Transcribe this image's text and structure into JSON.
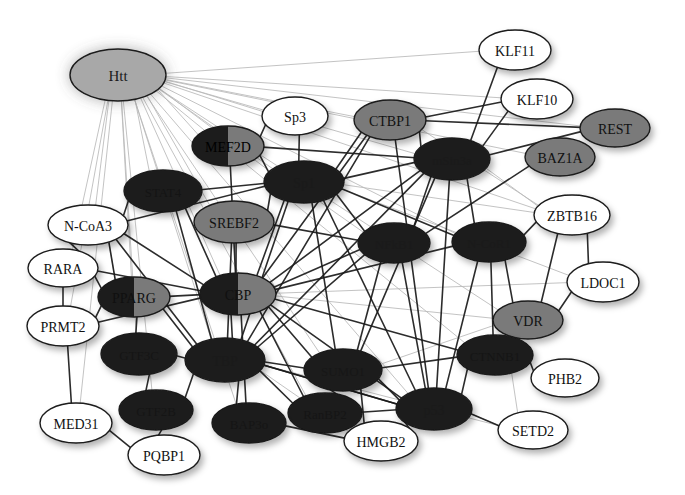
{
  "diagram": {
    "type": "protein-interaction-network",
    "background": "#ffffff",
    "palette": {
      "white_fill": "#ffffff",
      "light_gray_fill": "#a8a8a8",
      "mid_gray_fill": "#7a7a7a",
      "dark_fill": "#1d1d1d",
      "node_stroke": "#1a1a1a",
      "white_label": "#111111",
      "dark_label": "#000000",
      "edge_dark": "#1a1a1a",
      "edge_light": "#b9b9b9"
    },
    "nodes": [
      {
        "id": "Htt",
        "label": "Htt",
        "x": 118,
        "y": 75,
        "rx": 48,
        "ry": 26,
        "fill": "light_gray_fill",
        "labelColor": "#1a1a1a",
        "fontSize": 15,
        "twoTone": false
      },
      {
        "id": "KLF11",
        "label": "KLF11",
        "x": 515,
        "y": 50,
        "rx": 36,
        "ry": 20,
        "fill": "white_fill",
        "labelColor": "#111111",
        "fontSize": 14,
        "twoTone": false
      },
      {
        "id": "KLF10",
        "label": "KLF10",
        "x": 537,
        "y": 99,
        "rx": 36,
        "ry": 20,
        "fill": "white_fill",
        "labelColor": "#111111",
        "fontSize": 14,
        "twoTone": false
      },
      {
        "id": "Sp3",
        "label": "Sp3",
        "x": 295,
        "y": 116,
        "rx": 33,
        "ry": 19,
        "fill": "white_fill",
        "labelColor": "#111111",
        "fontSize": 14,
        "twoTone": false
      },
      {
        "id": "CTBP1",
        "label": "CTBP1",
        "x": 390,
        "y": 120,
        "rx": 36,
        "ry": 20,
        "fill": "mid_gray_fill",
        "labelColor": "#111111",
        "fontSize": 14,
        "twoTone": false
      },
      {
        "id": "REST",
        "label": "REST",
        "x": 615,
        "y": 128,
        "rx": 35,
        "ry": 19,
        "fill": "mid_gray_fill",
        "labelColor": "#111111",
        "fontSize": 14,
        "twoTone": false
      },
      {
        "id": "MEF2D",
        "label": "MEF2D",
        "x": 228,
        "y": 146,
        "rx": 36,
        "ry": 20,
        "fill": "dark_fill",
        "labelColor": "#000000",
        "fontSize": 14,
        "twoTone": true
      },
      {
        "id": "mSin3a",
        "label": "mSin3a",
        "x": 452,
        "y": 159,
        "rx": 38,
        "ry": 21,
        "fill": "dark_fill",
        "labelColor": "#1a1a1a",
        "fontSize": 13,
        "twoTone": false
      },
      {
        "id": "BAZ1A",
        "label": "BAZ1A",
        "x": 560,
        "y": 157,
        "rx": 35,
        "ry": 19,
        "fill": "mid_gray_fill",
        "labelColor": "#111111",
        "fontSize": 14,
        "twoTone": false
      },
      {
        "id": "STAT4",
        "label": "STAT4",
        "x": 163,
        "y": 191,
        "rx": 39,
        "ry": 21,
        "fill": "dark_fill",
        "labelColor": "#141414",
        "fontSize": 13,
        "twoTone": false
      },
      {
        "id": "Sp1",
        "label": "Sp1",
        "x": 304,
        "y": 182,
        "rx": 40,
        "ry": 21,
        "fill": "dark_fill",
        "labelColor": "#1a1a1a",
        "fontSize": 14,
        "twoTone": false
      },
      {
        "id": "SREBF2",
        "label": "SREBF2",
        "x": 234,
        "y": 222,
        "rx": 40,
        "ry": 21,
        "fill": "mid_gray_fill",
        "labelColor": "#111111",
        "fontSize": 14,
        "twoTone": false
      },
      {
        "id": "ZBTB16",
        "label": "ZBTB16",
        "x": 572,
        "y": 215,
        "rx": 38,
        "ry": 20,
        "fill": "white_fill",
        "labelColor": "#111111",
        "fontSize": 14,
        "twoTone": false
      },
      {
        "id": "N-CoA3",
        "label": "N-CoA3",
        "x": 88,
        "y": 225,
        "rx": 40,
        "ry": 20,
        "fill": "white_fill",
        "labelColor": "#111111",
        "fontSize": 14,
        "twoTone": false
      },
      {
        "id": "NFkB1",
        "label": "NFkB1",
        "x": 394,
        "y": 243,
        "rx": 36,
        "ry": 20,
        "fill": "dark_fill",
        "labelColor": "#1a1a1a",
        "fontSize": 13,
        "twoTone": false
      },
      {
        "id": "N-CoR1",
        "label": "N-CoR1",
        "x": 489,
        "y": 242,
        "rx": 37,
        "ry": 20,
        "fill": "dark_fill",
        "labelColor": "#1a1a1a",
        "fontSize": 13,
        "twoTone": false
      },
      {
        "id": "RARA",
        "label": "RARA",
        "x": 63,
        "y": 268,
        "rx": 35,
        "ry": 19,
        "fill": "white_fill",
        "labelColor": "#111111",
        "fontSize": 14,
        "twoTone": false
      },
      {
        "id": "LDOC1",
        "label": "LDOC1",
        "x": 603,
        "y": 282,
        "rx": 36,
        "ry": 20,
        "fill": "white_fill",
        "labelColor": "#111111",
        "fontSize": 14,
        "twoTone": false
      },
      {
        "id": "PPARG",
        "label": "PPARG",
        "x": 134,
        "y": 297,
        "rx": 36,
        "ry": 20,
        "fill": "dark_fill",
        "labelColor": "#101010",
        "fontSize": 14,
        "twoTone": true
      },
      {
        "id": "CBP",
        "label": "CBP",
        "x": 238,
        "y": 294,
        "rx": 38,
        "ry": 21,
        "fill": "dark_fill",
        "labelColor": "#101010",
        "fontSize": 14,
        "twoTone": true
      },
      {
        "id": "PRMT2",
        "label": "PRMT2",
        "x": 63,
        "y": 326,
        "rx": 36,
        "ry": 20,
        "fill": "white_fill",
        "labelColor": "#111111",
        "fontSize": 14,
        "twoTone": false
      },
      {
        "id": "VDR",
        "label": "VDR",
        "x": 528,
        "y": 320,
        "rx": 35,
        "ry": 19,
        "fill": "mid_gray_fill",
        "labelColor": "#111111",
        "fontSize": 14,
        "twoTone": false
      },
      {
        "id": "GTF3C",
        "label": "GTF3C",
        "x": 139,
        "y": 354,
        "rx": 38,
        "ry": 21,
        "fill": "dark_fill",
        "labelColor": "#151515",
        "fontSize": 13,
        "twoTone": false
      },
      {
        "id": "TBP",
        "label": "TBP",
        "x": 225,
        "y": 360,
        "rx": 40,
        "ry": 22,
        "fill": "dark_fill",
        "labelColor": "#1a1a1a",
        "fontSize": 14,
        "twoTone": false
      },
      {
        "id": "SUMO1",
        "label": "SUMO1",
        "x": 343,
        "y": 370,
        "rx": 39,
        "ry": 21,
        "fill": "dark_fill",
        "labelColor": "#171717",
        "fontSize": 13,
        "twoTone": false
      },
      {
        "id": "CTNNB1",
        "label": "CTNNB1",
        "x": 495,
        "y": 355,
        "rx": 38,
        "ry": 20,
        "fill": "dark_fill",
        "labelColor": "#151515",
        "fontSize": 13,
        "twoTone": false
      },
      {
        "id": "PHB2",
        "label": "PHB2",
        "x": 565,
        "y": 378,
        "rx": 34,
        "ry": 19,
        "fill": "white_fill",
        "labelColor": "#111111",
        "fontSize": 14,
        "twoTone": false
      },
      {
        "id": "GTF2B",
        "label": "GTF2B",
        "x": 156,
        "y": 410,
        "rx": 37,
        "ry": 20,
        "fill": "dark_fill",
        "labelColor": "#151515",
        "fontSize": 13,
        "twoTone": false
      },
      {
        "id": "RanBP2",
        "label": "RanBP2",
        "x": 325,
        "y": 413,
        "rx": 37,
        "ry": 20,
        "fill": "dark_fill",
        "labelColor": "#151515",
        "fontSize": 13,
        "twoTone": false
      },
      {
        "id": "BAP3o",
        "label": "BAP3o",
        "x": 249,
        "y": 423,
        "rx": 37,
        "ry": 20,
        "fill": "dark_fill",
        "labelColor": "#151515",
        "fontSize": 13,
        "twoTone": false
      },
      {
        "id": "p53",
        "label": "p53",
        "x": 434,
        "y": 409,
        "rx": 38,
        "ry": 21,
        "fill": "dark_fill",
        "labelColor": "#1a1a1a",
        "fontSize": 14,
        "twoTone": false
      },
      {
        "id": "SETD2",
        "label": "SETD2",
        "x": 533,
        "y": 430,
        "rx": 35,
        "ry": 19,
        "fill": "white_fill",
        "labelColor": "#111111",
        "fontSize": 14,
        "twoTone": false
      },
      {
        "id": "MED31",
        "label": "MED31",
        "x": 76,
        "y": 423,
        "rx": 36,
        "ry": 20,
        "fill": "white_fill",
        "labelColor": "#111111",
        "fontSize": 14,
        "twoTone": false
      },
      {
        "id": "PQBP1",
        "label": "PQBP1",
        "x": 164,
        "y": 455,
        "rx": 36,
        "ry": 20,
        "fill": "white_fill",
        "labelColor": "#111111",
        "fontSize": 14,
        "twoTone": false
      },
      {
        "id": "HMGB2",
        "label": "HMGB2",
        "x": 381,
        "y": 441,
        "rx": 37,
        "ry": 20,
        "fill": "white_fill",
        "labelColor": "#111111",
        "fontSize": 14,
        "twoTone": false
      }
    ],
    "edges_light": [
      {
        "from": "Htt",
        "to": "KLF11"
      },
      {
        "from": "Htt",
        "to": "KLF10"
      },
      {
        "from": "Htt",
        "to": "REST"
      },
      {
        "from": "Htt",
        "to": "BAZ1A"
      },
      {
        "from": "Htt",
        "to": "CTBP1"
      },
      {
        "from": "Htt",
        "to": "Sp3"
      },
      {
        "from": "Htt",
        "to": "MEF2D"
      },
      {
        "from": "Htt",
        "to": "mSin3a"
      },
      {
        "from": "Htt",
        "to": "Sp1"
      },
      {
        "from": "Htt",
        "to": "SREBF2"
      },
      {
        "from": "Htt",
        "to": "STAT4"
      },
      {
        "from": "Htt",
        "to": "N-CoA3"
      },
      {
        "from": "Htt",
        "to": "RARA"
      },
      {
        "from": "Htt",
        "to": "NFkB1"
      },
      {
        "from": "Htt",
        "to": "N-CoR1"
      },
      {
        "from": "Htt",
        "to": "ZBTB16"
      },
      {
        "from": "Htt",
        "to": "CBP"
      },
      {
        "from": "Htt",
        "to": "PPARG"
      },
      {
        "from": "Htt",
        "to": "TBP"
      },
      {
        "from": "Htt",
        "to": "GTF3C"
      },
      {
        "from": "Htt",
        "to": "GTF2B"
      },
      {
        "from": "Htt",
        "to": "SUMO1"
      },
      {
        "from": "Htt",
        "to": "p53"
      },
      {
        "from": "Htt",
        "to": "VDR"
      },
      {
        "from": "Htt",
        "to": "PRMT2"
      },
      {
        "from": "Htt",
        "to": "MED31"
      },
      {
        "from": "Htt",
        "to": "CTNNB1"
      },
      {
        "from": "Htt",
        "to": "BAP3o"
      },
      {
        "from": "Htt",
        "to": "RanBP2"
      },
      {
        "from": "Sp1",
        "to": "ZBTB16"
      },
      {
        "from": "Sp1",
        "to": "LDOC1"
      },
      {
        "from": "mSin3a",
        "to": "ZBTB16"
      },
      {
        "from": "CTBP1",
        "to": "ZBTB16"
      },
      {
        "from": "CBP",
        "to": "LDOC1"
      },
      {
        "from": "p53",
        "to": "SETD2"
      },
      {
        "from": "CTNNB1",
        "to": "SETD2"
      },
      {
        "from": "TBP",
        "to": "SETD2"
      },
      {
        "from": "SUMO1",
        "to": "VDR"
      },
      {
        "from": "N-CoA3",
        "to": "PPARG"
      },
      {
        "from": "CBP",
        "to": "VDR"
      },
      {
        "from": "TBP",
        "to": "HMGB2"
      }
    ],
    "edges_dark": [
      {
        "from": "KLF11",
        "to": "mSin3a"
      },
      {
        "from": "KLF10",
        "to": "mSin3a"
      },
      {
        "from": "KLF10",
        "to": "CTBP1"
      },
      {
        "from": "REST",
        "to": "mSin3a"
      },
      {
        "from": "REST",
        "to": "CTBP1"
      },
      {
        "from": "BAZ1A",
        "to": "NFkB1"
      },
      {
        "from": "CTBP1",
        "to": "mSin3a"
      },
      {
        "from": "CTBP1",
        "to": "Sp1"
      },
      {
        "from": "CTBP1",
        "to": "CBP"
      },
      {
        "from": "CTBP1",
        "to": "TBP"
      },
      {
        "from": "CTBP1",
        "to": "p53"
      },
      {
        "from": "Sp3",
        "to": "Sp1"
      },
      {
        "from": "Sp3",
        "to": "MEF2D"
      },
      {
        "from": "MEF2D",
        "to": "Sp1"
      },
      {
        "from": "MEF2D",
        "to": "CBP"
      },
      {
        "from": "MEF2D",
        "to": "mSin3a"
      },
      {
        "from": "STAT4",
        "to": "Sp1"
      },
      {
        "from": "STAT4",
        "to": "CBP"
      },
      {
        "from": "STAT4",
        "to": "N-CoA3"
      },
      {
        "from": "STAT4",
        "to": "TBP"
      },
      {
        "from": "Sp1",
        "to": "mSin3a"
      },
      {
        "from": "Sp1",
        "to": "NFkB1"
      },
      {
        "from": "Sp1",
        "to": "N-CoR1"
      },
      {
        "from": "Sp1",
        "to": "CBP"
      },
      {
        "from": "Sp1",
        "to": "TBP"
      },
      {
        "from": "Sp1",
        "to": "p53"
      },
      {
        "from": "Sp1",
        "to": "SUMO1"
      },
      {
        "from": "Sp1",
        "to": "SREBF2"
      },
      {
        "from": "SREBF2",
        "to": "CBP"
      },
      {
        "from": "SREBF2",
        "to": "TBP"
      },
      {
        "from": "SREBF2",
        "to": "NFkB1"
      },
      {
        "from": "mSin3a",
        "to": "NFkB1"
      },
      {
        "from": "mSin3a",
        "to": "N-CoR1"
      },
      {
        "from": "mSin3a",
        "to": "CBP"
      },
      {
        "from": "mSin3a",
        "to": "TBP"
      },
      {
        "from": "mSin3a",
        "to": "p53"
      },
      {
        "from": "mSin3a",
        "to": "SUMO1"
      },
      {
        "from": "ZBTB16",
        "to": "N-CoR1"
      },
      {
        "from": "ZBTB16",
        "to": "LDOC1"
      },
      {
        "from": "ZBTB16",
        "to": "VDR"
      },
      {
        "from": "N-CoA3",
        "to": "RARA"
      },
      {
        "from": "N-CoA3",
        "to": "CBP"
      },
      {
        "from": "N-CoA3",
        "to": "PPARG"
      },
      {
        "from": "N-CoA3",
        "to": "TBP"
      },
      {
        "from": "N-CoA3",
        "to": "Sp1"
      },
      {
        "from": "NFkB1",
        "to": "CBP"
      },
      {
        "from": "NFkB1",
        "to": "p53"
      },
      {
        "from": "NFkB1",
        "to": "TBP"
      },
      {
        "from": "NFkB1",
        "to": "SUMO1"
      },
      {
        "from": "N-CoR1",
        "to": "CBP"
      },
      {
        "from": "N-CoR1",
        "to": "p53"
      },
      {
        "from": "N-CoR1",
        "to": "VDR"
      },
      {
        "from": "N-CoR1",
        "to": "CTNNB1"
      },
      {
        "from": "RARA",
        "to": "PRMT2"
      },
      {
        "from": "RARA",
        "to": "PPARG"
      },
      {
        "from": "RARA",
        "to": "CBP"
      },
      {
        "from": "PRMT2",
        "to": "PPARG"
      },
      {
        "from": "PRMT2",
        "to": "CBP"
      },
      {
        "from": "PPARG",
        "to": "CBP"
      },
      {
        "from": "PPARG",
        "to": "TBP"
      },
      {
        "from": "CBP",
        "to": "TBP"
      },
      {
        "from": "CBP",
        "to": "p53"
      },
      {
        "from": "CBP",
        "to": "SUMO1"
      },
      {
        "from": "CBP",
        "to": "CTNNB1"
      },
      {
        "from": "CBP",
        "to": "RanBP2"
      },
      {
        "from": "CBP",
        "to": "BAP3o"
      },
      {
        "from": "VDR",
        "to": "CTNNB1"
      },
      {
        "from": "VDR",
        "to": "LDOC1"
      },
      {
        "from": "CTNNB1",
        "to": "p53"
      },
      {
        "from": "CTNNB1",
        "to": "PHB2"
      },
      {
        "from": "GTF3C",
        "to": "TBP"
      },
      {
        "from": "GTF3C",
        "to": "GTF2B"
      },
      {
        "from": "GTF3C",
        "to": "PPARG"
      },
      {
        "from": "GTF2B",
        "to": "TBP"
      },
      {
        "from": "TBP",
        "to": "BAP3o"
      },
      {
        "from": "TBP",
        "to": "RanBP2"
      },
      {
        "from": "TBP",
        "to": "SUMO1"
      },
      {
        "from": "TBP",
        "to": "p53"
      },
      {
        "from": "SUMO1",
        "to": "p53"
      },
      {
        "from": "SUMO1",
        "to": "RanBP2"
      },
      {
        "from": "RanBP2",
        "to": "p53"
      },
      {
        "from": "p53",
        "to": "HMGB2"
      },
      {
        "from": "p53",
        "to": "SETD2"
      },
      {
        "from": "HMGB2",
        "to": "BAP3o"
      },
      {
        "from": "MED31",
        "to": "PQBP1"
      },
      {
        "from": "PQBP1",
        "to": "GTF2B"
      },
      {
        "from": "MED31",
        "to": "PRMT2"
      },
      {
        "from": "TBP",
        "to": "p53"
      },
      {
        "from": "SUMO1",
        "to": "CTNNB1"
      },
      {
        "from": "SUMO1",
        "to": "HMGB2"
      }
    ]
  }
}
